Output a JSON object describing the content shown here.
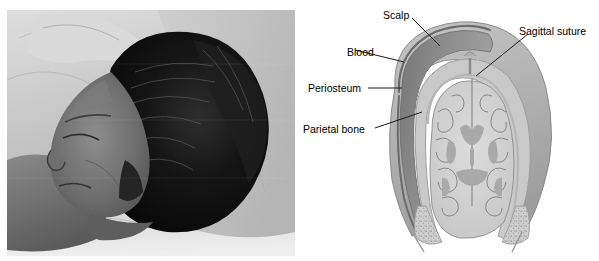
{
  "figure": {
    "type": "medical-illustration",
    "panels": [
      {
        "id": "photograph",
        "name": "newborn-head-photograph",
        "modality": "grayscale clinical photograph",
        "description": "Newborn infant lying on light bedding, head in profile, showing a rounded scalp swelling over the parietal region"
      },
      {
        "id": "diagram",
        "name": "skull-cross-section-diagram",
        "modality": "grayscale coronal cross-section drawing",
        "description": "Coronal section of the infant skull and brain showing blood collected beneath the periosteum over the parietal bone, bounded by the sagittal suture"
      }
    ]
  },
  "labels": [
    {
      "id": "scalp",
      "text": "Scalp",
      "x": 383,
      "y": 10
    },
    {
      "id": "sagittal-suture",
      "text": "Sagittal suture",
      "x": 519,
      "y": 26
    },
    {
      "id": "blood",
      "text": "Blood",
      "x": 347,
      "y": 47
    },
    {
      "id": "periosteum",
      "text": "Periosteum",
      "x": 308,
      "y": 83
    },
    {
      "id": "parietal-bone",
      "text": "Parietal bone",
      "x": 303,
      "y": 124
    }
  ],
  "colors": {
    "background": "#ffffff",
    "label_text": "#000000",
    "leader_line": "#1a1a1a",
    "scalp_outer": "#b9b9b9",
    "blood": "#8f8f8f",
    "periosteum": "#a5a5a5",
    "bone": "#c9c9c9",
    "brain_cortex": "#d2d2d2",
    "brain_deep": "#a9a9a9",
    "photo_dark": "#141414",
    "photo_light": "#e6e6e6"
  }
}
